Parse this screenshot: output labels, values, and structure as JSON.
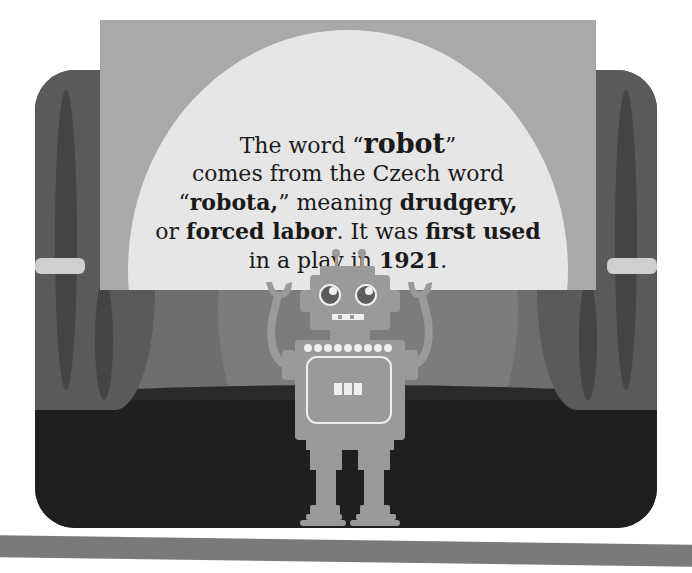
{
  "fact": {
    "line1_pre": "The word “",
    "line1_bold": "robot",
    "line1_post": "”",
    "line2": "comes from the Czech word",
    "line3_pre": "“",
    "line3_bold1": "robota,",
    "line3_mid": "” meaning ",
    "line3_bold2": "drudgery,",
    "line4_pre": "or ",
    "line4_bold1": "forced labor",
    "line4_mid": ". It was ",
    "line4_bold2": "first used",
    "line5_pre": "in a play in ",
    "line5_bold": "1921",
    "line5_post": "."
  },
  "illustration": {
    "subject": "robot-on-stage",
    "colors": {
      "stage": "#2b2b2b",
      "curtain": "#5a5a5a",
      "card": "#a9a9a9",
      "spotlight": "#e6e6e6",
      "robot": "#9a9a9a",
      "footer_bar": "#7a7a7a"
    }
  }
}
